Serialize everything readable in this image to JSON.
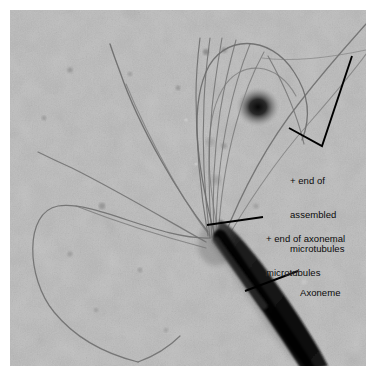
{
  "figure": {
    "kind": "electron-micrograph",
    "width": 376,
    "height": 376,
    "plate": {
      "left": 10,
      "top": 10,
      "width": 356,
      "height": 356,
      "background_color": "#b4b4b4",
      "page_margin_color": "#ffffff"
    }
  },
  "annotations": {
    "assembled": {
      "line1": "+ end of",
      "line2": "assembled",
      "line3": "microtubules",
      "pointer": "bracket",
      "color": "#0a0a0a"
    },
    "axonemal": {
      "line1": "+ end of axonemal",
      "line2": "microtubules",
      "pointer": "leader-line",
      "color": "#0a0a0a"
    },
    "axoneme": {
      "line1": "Axoneme",
      "pointer": "leader-line",
      "color": "#0a0a0a"
    }
  },
  "structures": {
    "axoneme": {
      "label": "axoneme",
      "description": "thick dark rod",
      "color": "#1a1a1a"
    },
    "microtubules": {
      "label": "microtubules",
      "description": "fan of thin filaments",
      "color": "#6b6b6b"
    },
    "dark_blob": {
      "label": "dark particle",
      "color": "#141414"
    }
  }
}
